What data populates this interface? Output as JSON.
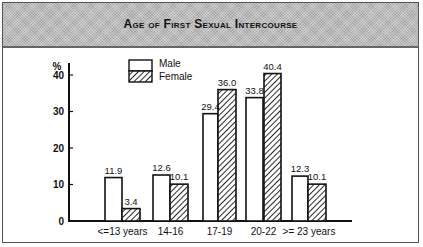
{
  "title": "Age of First Sexual Intercourse",
  "y_unit": "%",
  "legend": {
    "male": "Male",
    "female": "Female"
  },
  "value_labels": {
    "male": [
      "11.9",
      "12.6",
      "29.4",
      "33.8",
      "12.3"
    ],
    "female": [
      "3.4",
      "10.1",
      "36.0",
      "40.4",
      "10.1"
    ]
  },
  "chart_data": {
    "type": "bar",
    "title": "Age of First Sexual Intercourse",
    "xlabel": "",
    "ylabel": "%",
    "ylim": [
      0,
      45
    ],
    "yticks": [
      0,
      10,
      20,
      30,
      40
    ],
    "grid": false,
    "legend_position": "top-left inside plot",
    "categories": [
      "<=13 years",
      "14-16",
      "17-19",
      "20-22",
      ">= 23 years"
    ],
    "series": [
      {
        "name": "Male",
        "style": "white fill",
        "values": [
          11.9,
          12.6,
          29.4,
          33.8,
          12.3
        ]
      },
      {
        "name": "Female",
        "style": "diagonal hatch",
        "values": [
          3.4,
          10.1,
          36.0,
          40.4,
          10.1
        ]
      }
    ]
  },
  "colors": {
    "header_bg": "#bdbdbd",
    "ink": "#111111"
  }
}
